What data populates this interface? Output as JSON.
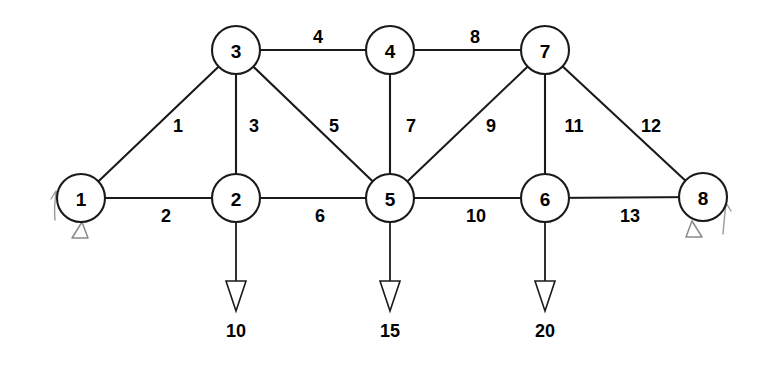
{
  "diagram": {
    "type": "truss-diagram",
    "background_color": "#ffffff",
    "line_color": "#1a1a1a",
    "support_sketch_color": "#8a8a8a",
    "width": 771,
    "height": 370
  },
  "nodes": [
    {
      "id": "1",
      "label": "1",
      "x": 81,
      "y": 198,
      "r": 24
    },
    {
      "id": "2",
      "label": "2",
      "x": 236,
      "y": 198,
      "r": 24
    },
    {
      "id": "3",
      "label": "3",
      "x": 236,
      "y": 50,
      "r": 24
    },
    {
      "id": "4",
      "label": "4",
      "x": 390,
      "y": 50,
      "r": 24
    },
    {
      "id": "5",
      "label": "5",
      "x": 390,
      "y": 198,
      "r": 24
    },
    {
      "id": "6",
      "label": "6",
      "x": 545,
      "y": 198,
      "r": 24
    },
    {
      "id": "7",
      "label": "7",
      "x": 545,
      "y": 50,
      "r": 24
    },
    {
      "id": "8",
      "label": "8",
      "x": 703,
      "y": 197,
      "r": 24
    }
  ],
  "members": [
    {
      "id": "1",
      "label": "1",
      "from": "1",
      "to": "3",
      "label_x": 178,
      "label_y": 126
    },
    {
      "id": "2",
      "label": "2",
      "from": "1",
      "to": "2",
      "label_x": 166,
      "label_y": 216
    },
    {
      "id": "3",
      "label": "3",
      "from": "2",
      "to": "3",
      "label_x": 254,
      "label_y": 126
    },
    {
      "id": "4",
      "label": "4",
      "from": "3",
      "to": "4",
      "label_x": 318,
      "label_y": 37
    },
    {
      "id": "5",
      "label": "5",
      "from": "3",
      "to": "5",
      "label_x": 334,
      "label_y": 126
    },
    {
      "id": "6",
      "label": "6",
      "from": "2",
      "to": "5",
      "label_x": 320,
      "label_y": 216
    },
    {
      "id": "7",
      "label": "7",
      "from": "4",
      "to": "5",
      "label_x": 411,
      "label_y": 126
    },
    {
      "id": "8",
      "label": "8",
      "from": "4",
      "to": "7",
      "label_x": 475,
      "label_y": 37
    },
    {
      "id": "9",
      "label": "9",
      "from": "5",
      "to": "7",
      "label_x": 491,
      "label_y": 126
    },
    {
      "id": "10",
      "label": "10",
      "from": "5",
      "to": "6",
      "label_x": 476,
      "label_y": 216
    },
    {
      "id": "11",
      "label": "11",
      "from": "6",
      "to": "7",
      "label_x": 574,
      "label_y": 126
    },
    {
      "id": "12",
      "label": "12",
      "from": "7",
      "to": "8",
      "label_x": 651,
      "label_y": 126
    },
    {
      "id": "13",
      "label": "13",
      "from": "6",
      "to": "8",
      "label_x": 630,
      "label_y": 216
    }
  ],
  "loads": [
    {
      "id": "load-node-2",
      "node": "2",
      "value": "10",
      "direction": "down",
      "x": 236,
      "shaft_top": 222,
      "shaft_bottom": 283,
      "head_tip_y": 310,
      "label_y": 331
    },
    {
      "id": "load-node-5",
      "node": "5",
      "value": "15",
      "direction": "down",
      "x": 390,
      "shaft_top": 222,
      "shaft_bottom": 283,
      "head_tip_y": 310,
      "label_y": 331
    },
    {
      "id": "load-node-6",
      "node": "6",
      "value": "20",
      "direction": "down",
      "x": 545,
      "shaft_top": 222,
      "shaft_bottom": 283,
      "head_tip_y": 310,
      "label_y": 331
    }
  ],
  "supports": [
    {
      "id": "support-node-1",
      "node": "1",
      "kind": "pinned-sketch",
      "triangle_x": 80,
      "triangle_y": 223
    },
    {
      "id": "support-node-8",
      "node": "8",
      "kind": "pinned-sketch",
      "triangle_x": 693,
      "triangle_y": 222
    }
  ],
  "reaction_sketches": [
    {
      "id": "reaction-node-1",
      "node": "1",
      "direction": "up",
      "x": 55,
      "y_top": 191,
      "y_bottom": 219
    },
    {
      "id": "reaction-node-8",
      "node": "8",
      "direction": "up",
      "x": 725,
      "y_top": 203,
      "y_bottom": 233
    }
  ]
}
